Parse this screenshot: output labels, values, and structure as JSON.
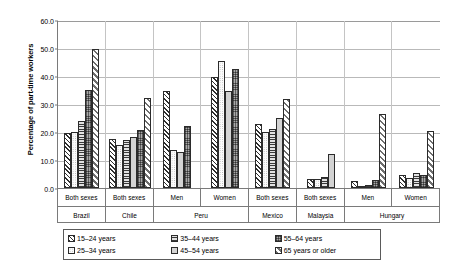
{
  "chart_data": {
    "type": "bar",
    "title": "",
    "xlabel": "",
    "ylabel": "Percentage of part-time workers",
    "ylim": [
      0,
      60
    ],
    "ytick_labels": [
      "0.0",
      "10.0",
      "20.0",
      "30.0",
      "40.0",
      "50.0",
      "60.0"
    ],
    "ytick_values": [
      0,
      10,
      20,
      30,
      40,
      50,
      60
    ],
    "grid": true,
    "legend_position": "bottom",
    "series_names": [
      "15–24 years",
      "25–34 years",
      "35–44 years",
      "45–54 years",
      "55–64 years",
      "65 years or older"
    ],
    "countries": [
      {
        "name": "Brazil",
        "span": 1
      },
      {
        "name": "Chile",
        "span": 1
      },
      {
        "name": "Peru",
        "span": 2
      },
      {
        "name": "Mexico",
        "span": 1
      },
      {
        "name": "Malaysia",
        "span": 1
      },
      {
        "name": "Hungary",
        "span": 2
      }
    ],
    "categories": [
      "Both sexes",
      "Both sexes",
      "Men",
      "Women",
      "Both sexes",
      "Both sexes",
      "Men",
      "Women"
    ],
    "groups": [
      {
        "country": "Brazil",
        "category": "Both sexes",
        "bars": [
          {
            "series": 0,
            "label": "15–24 years",
            "value": 19.8
          },
          {
            "series": 1,
            "label": "25–34 years",
            "value": 20.0
          },
          {
            "series": 2,
            "label": "35–44 years",
            "value": 23.8
          },
          {
            "series": 4,
            "label": "55–64 years",
            "value": 35.0
          },
          {
            "series": 5,
            "label": "65 years or older",
            "value": 49.5
          }
        ]
      },
      {
        "country": "Chile",
        "category": "Both sexes",
        "bars": [
          {
            "series": 0,
            "label": "15–24 years",
            "value": 17.5
          },
          {
            "series": 1,
            "label": "25–34 years",
            "value": 15.5
          },
          {
            "series": 2,
            "label": "35–44 years",
            "value": 17.0
          },
          {
            "series": 3,
            "label": "45–54 years",
            "value": 18.3
          },
          {
            "series": 4,
            "label": "55–64 years",
            "value": 20.8
          },
          {
            "series": 5,
            "label": "65 years or older",
            "value": 32.0
          }
        ]
      },
      {
        "country": "Peru",
        "category": "Men",
        "bars": [
          {
            "series": 0,
            "label": "15–24 years",
            "value": 34.8
          },
          {
            "series": 1,
            "label": "25–34 years",
            "value": 13.5
          },
          {
            "series": 3,
            "label": "45–54 years",
            "value": 13.0
          },
          {
            "series": 4,
            "label": "55–64 years",
            "value": 22.0
          }
        ]
      },
      {
        "country": "Peru",
        "category": "Women",
        "bars": [
          {
            "series": 0,
            "label": "15–24 years",
            "value": 39.8
          },
          {
            "series": 1,
            "label": "25–34 years",
            "value": 45.3
          },
          {
            "series": 3,
            "label": "45–54 years",
            "value": 34.8
          },
          {
            "series": 4,
            "label": "55–64 years",
            "value": 42.5
          }
        ]
      },
      {
        "country": "Mexico",
        "category": "Both sexes",
        "bars": [
          {
            "series": 0,
            "label": "15–24 years",
            "value": 23.0
          },
          {
            "series": 1,
            "label": "25–34 years",
            "value": 20.0
          },
          {
            "series": 2,
            "label": "35–44 years",
            "value": 21.0
          },
          {
            "series": 3,
            "label": "45–54 years",
            "value": 25.0
          },
          {
            "series": 5,
            "label": "65 years or older",
            "value": 31.8
          }
        ]
      },
      {
        "country": "Malaysia",
        "category": "Both sexes",
        "bars": [
          {
            "series": 0,
            "label": "15–24 years",
            "value": 3.3
          },
          {
            "series": 1,
            "label": "25–34 years",
            "value": 3.3
          },
          {
            "series": 2,
            "label": "35–44 years",
            "value": 4.0
          },
          {
            "series": 3,
            "label": "45–54 years",
            "value": 12.0
          }
        ]
      },
      {
        "country": "Hungary",
        "category": "Men",
        "bars": [
          {
            "series": 0,
            "label": "15–24 years",
            "value": 2.5
          },
          {
            "series": 1,
            "label": "25–34 years",
            "value": 0.8
          },
          {
            "series": 2,
            "label": "35–44 years",
            "value": 1.0
          },
          {
            "series": 4,
            "label": "55–64 years",
            "value": 2.8
          },
          {
            "series": 5,
            "label": "65 years or older",
            "value": 26.5
          }
        ]
      },
      {
        "country": "Hungary",
        "category": "Women",
        "bars": [
          {
            "series": 0,
            "label": "15–24 years",
            "value": 4.5
          },
          {
            "series": 1,
            "label": "25–34 years",
            "value": 3.5
          },
          {
            "series": 2,
            "label": "35–44 years",
            "value": 5.5
          },
          {
            "series": 4,
            "label": "55–64 years",
            "value": 4.5
          },
          {
            "series": 5,
            "label": "65 years or older",
            "value": 20.5
          }
        ]
      }
    ],
    "legend": [
      {
        "label": "15–24 years",
        "series": 0
      },
      {
        "label": "35–44 years",
        "series": 2
      },
      {
        "label": "55–64 years",
        "series": 4
      },
      {
        "label": "25–34 years",
        "series": 1
      },
      {
        "label": "45–54 years",
        "series": 3
      },
      {
        "label": "65 years or older",
        "series": 5
      }
    ]
  },
  "colors": {
    "axis": "#7a7a7a",
    "gridline": "#b9b9b9",
    "bar_outline": "#2b2b2b",
    "background": "#ffffff",
    "text": "#000000"
  }
}
